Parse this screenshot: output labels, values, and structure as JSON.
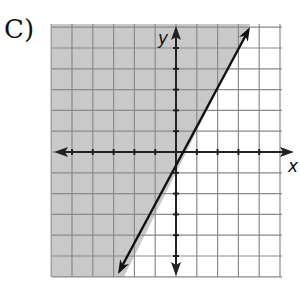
{
  "option_label": "C)",
  "chart_data": {
    "type": "line",
    "title": "",
    "xlabel": "x",
    "ylabel": "y",
    "xlim": [
      -6,
      5
    ],
    "ylim": [
      -6,
      6
    ],
    "grid": true,
    "series": [
      {
        "name": "boundary line",
        "equation": "y = 2x - 1",
        "style": "solid",
        "x": [
          -2.8,
          3.6
        ],
        "y": [
          -6.6,
          6.2
        ]
      }
    ],
    "shaded_region": "left/above of line (y > 2x - 1)",
    "shade_color": "#c9c9c9",
    "axis_color": "#222222",
    "grid_color": "#8a8a8a"
  }
}
